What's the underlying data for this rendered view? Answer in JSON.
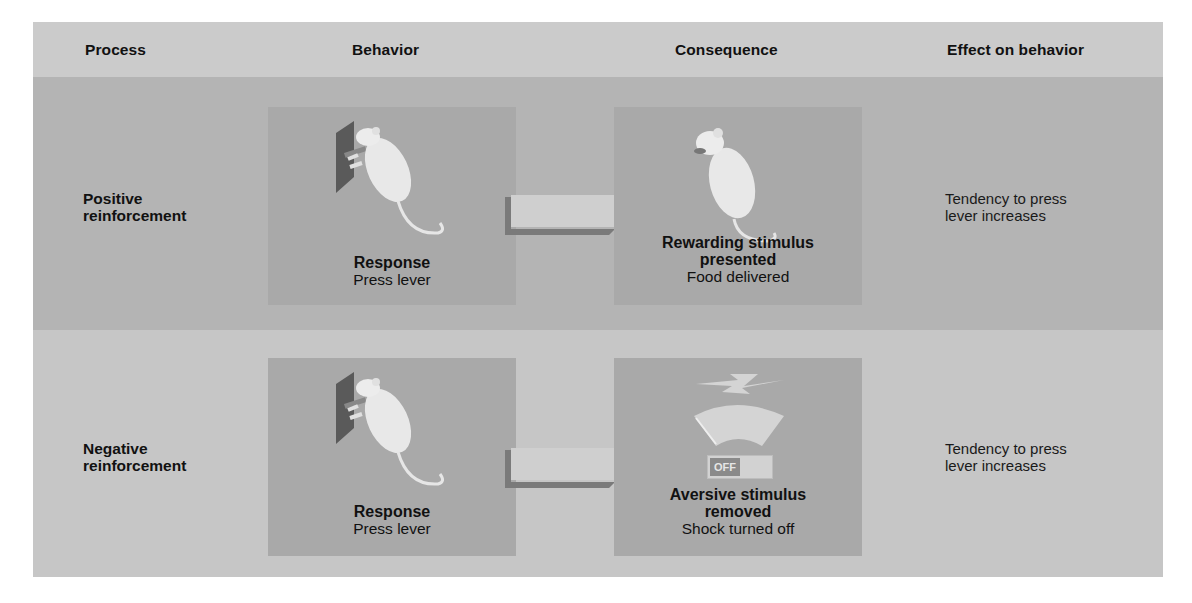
{
  "header": {
    "process": "Process",
    "behavior": "Behavior",
    "consequence": "Consequence",
    "effect": "Effect on behavior"
  },
  "rows": [
    {
      "process": [
        "Positive",
        "reinforcement"
      ],
      "behavior": {
        "title": "Response",
        "detail": "Press lever",
        "icon": "rat-pressing-lever-icon"
      },
      "consequence": {
        "title": [
          "Rewarding stimulus",
          "presented"
        ],
        "detail": "Food delivered",
        "icon": "rat-eating-icon"
      },
      "effect": [
        "Tendency to press",
        "lever increases"
      ]
    },
    {
      "process": [
        "Negative",
        "reinforcement"
      ],
      "behavior": {
        "title": "Response",
        "detail": "Press lever",
        "icon": "rat-pressing-lever-icon"
      },
      "consequence": {
        "title": [
          "Aversive stimulus",
          "removed"
        ],
        "detail": "Shock turned off",
        "icon": "shock-off-switch-icon",
        "switch_label": "OFF"
      },
      "effect": [
        "Tendency to press",
        "lever increases"
      ]
    }
  ],
  "colors": {
    "header_bg": "#cbcbcb",
    "row1_bg": "#b4b4b4",
    "row2_bg": "#c6c6c6",
    "panel_bg": "#a9a9a9",
    "arrow_light": "#cfcfcf",
    "arrow_shadow": "#7a7a7a",
    "lever_plate": "#5a5a5a"
  }
}
